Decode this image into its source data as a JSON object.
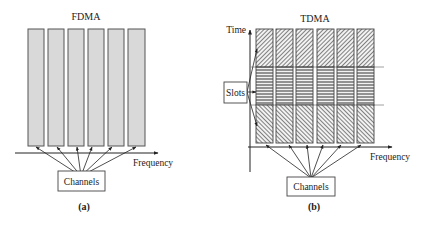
{
  "colors": {
    "bar_fill": "#d9d9d9",
    "bar_stroke": "#555555",
    "line": "#222222",
    "divider": "#888888"
  },
  "fdma": {
    "title": "FDMA",
    "axis_label": "Frequency",
    "channels_label": "Channels",
    "caption": "(a)",
    "bar_count": 6
  },
  "tdma": {
    "title": "TDMA",
    "time_label": "Time",
    "axis_label": "Frequency",
    "slots_label": "Slots",
    "channels_label": "Channels",
    "caption": "(b)",
    "bar_count": 6,
    "slot_patterns": [
      "diagonal-backslash",
      "horizontal",
      "diagonal-slash"
    ]
  }
}
